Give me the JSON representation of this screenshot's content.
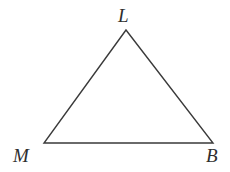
{
  "figure": {
    "kind": "geometry-diagram",
    "shape_name": "triangle",
    "background_color": "#ffffff",
    "stroke_color": "#3a3a3a",
    "stroke_width": 1.4,
    "label_color": "#2e2e2e",
    "canvas": {
      "width": 230,
      "height": 172
    }
  },
  "vertices": [
    {
      "id": "L",
      "label": "L",
      "x": 126,
      "y": 30,
      "label_x": 118,
      "label_y": 6
    },
    {
      "id": "M",
      "label": "M",
      "x": 44,
      "y": 143,
      "label_x": 13,
      "label_y": 146
    },
    {
      "id": "B",
      "label": "B",
      "x": 213,
      "y": 143,
      "label_x": 206,
      "label_y": 146
    }
  ],
  "edges": [
    {
      "id": "LM",
      "from": "L",
      "to": "M"
    },
    {
      "id": "MB",
      "from": "M",
      "to": "B"
    },
    {
      "id": "BL",
      "from": "B",
      "to": "L"
    }
  ],
  "polygon_points": "126,30 44,143 213,143"
}
